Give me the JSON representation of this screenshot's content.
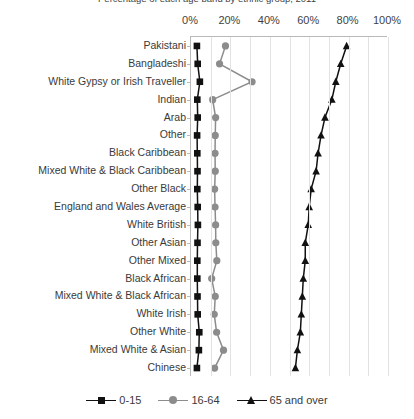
{
  "chart_data": {
    "type": "line",
    "orientation": "horizontal",
    "title": "Percentage of each age band by ethnic group, 2011",
    "xlabel": "",
    "ylabel": "",
    "xlim": [
      0,
      100
    ],
    "xticks": [
      0,
      20,
      40,
      60,
      80,
      100
    ],
    "xtick_labels": [
      "0%",
      "20%",
      "40%",
      "60%",
      "80%",
      "100%"
    ],
    "grid": "vertical minor gridlines every 10%",
    "legend_position": "bottom-center",
    "categories": [
      "Pakistani",
      "Bangladeshi",
      "White Gypsy or Irish Traveller",
      "Indian",
      "Arab",
      "Other",
      "Black Caribbean",
      "Mixed White & Black Caribbean",
      "Other Black",
      "England and Wales Average",
      "White British",
      "Other Asian",
      "Other Mixed",
      "Black African",
      "Mixed White & Black African",
      "White Irish",
      "Other White",
      "Mixed White & Asian",
      "Chinese"
    ],
    "series": [
      {
        "name": "0-15",
        "marker": "square",
        "color": "#111111",
        "values": [
          3.0,
          3.4,
          4.5,
          3.2,
          3.4,
          3.1,
          3.2,
          3.3,
          3.2,
          3.4,
          3.5,
          3.3,
          3.2,
          3.2,
          3.3,
          3.4,
          4.2,
          4.0,
          3.0
        ]
      },
      {
        "name": "16-64",
        "marker": "circle",
        "color": "#8c8c8c",
        "values": [
          17.5,
          14.5,
          31.0,
          11.0,
          12.5,
          12.3,
          12.2,
          12.3,
          12.0,
          12.2,
          12.5,
          12.6,
          13.1,
          10.5,
          12.3,
          11.8,
          13.0,
          16.5,
          12.0
        ]
      },
      {
        "name": "65 and over",
        "marker": "triangle",
        "color": "#111111",
        "values": [
          79.0,
          76.0,
          73.5,
          71.5,
          68.0,
          66.0,
          64.5,
          63.5,
          61.0,
          60.0,
          59.5,
          58.0,
          58.0,
          57.0,
          56.5,
          56.0,
          55.5,
          54.0,
          53.0
        ]
      }
    ]
  },
  "legend": {
    "items": [
      {
        "label": "0-15",
        "marker": "square-marker",
        "color": "#111111"
      },
      {
        "label": "16-64",
        "marker": "circle-marker",
        "color": "#8c8c8c"
      },
      {
        "label": "65 and over",
        "marker": "triangle-marker",
        "color": "#111111"
      }
    ]
  },
  "colors": {
    "axis": "#b9b9b9",
    "gridline": "#e2e2e2",
    "text": "#3a3a3a",
    "background": "#ffffff"
  }
}
